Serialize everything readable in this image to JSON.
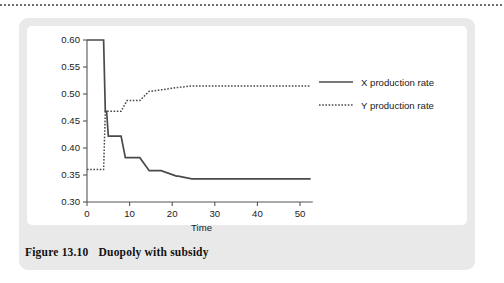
{
  "figure": {
    "caption_number": "Figure 13.10",
    "caption_text": "Duopoly with subsidy"
  },
  "chart_data": {
    "type": "line",
    "title": "",
    "xlabel": "Time",
    "ylabel": "",
    "xlim": [
      0,
      53
    ],
    "ylim": [
      0.3,
      0.6
    ],
    "xticks": [
      0,
      10,
      20,
      30,
      40,
      50
    ],
    "xtick_labels": [
      "0",
      "10",
      "20",
      "30",
      "40",
      "50"
    ],
    "yticks": [
      0.3,
      0.35,
      0.4,
      0.45,
      0.5,
      0.55,
      0.6
    ],
    "ytick_labels": [
      "0.30",
      "0.35",
      "0.40",
      "0.45",
      "0.50",
      "0.55",
      "0.60"
    ],
    "grid": false,
    "legend_position": "right",
    "line_color": "#4a4a4a",
    "series": [
      {
        "name": "X production rate",
        "style": "solid",
        "x": [
          0,
          3.6,
          3.9,
          4.3,
          4.6,
          5.0,
          5.4,
          7.6,
          8.0,
          9.0,
          9.4,
          12.0,
          12.4,
          14.6,
          15.0,
          17.0,
          17.4,
          21.0,
          21.4,
          24.6,
          25.0,
          52.5
        ],
        "y": [
          0.6,
          0.6,
          0.6,
          0.468,
          0.468,
          0.422,
          0.422,
          0.422,
          0.422,
          0.382,
          0.382,
          0.382,
          0.382,
          0.358,
          0.358,
          0.358,
          0.358,
          0.348,
          0.348,
          0.343,
          0.343,
          0.343
        ]
      },
      {
        "name": "Y production rate",
        "style": "dotted",
        "x": [
          0,
          3.6,
          3.9,
          4.3,
          4.6,
          7.6,
          8.0,
          9.4,
          9.8,
          12.0,
          12.4,
          14.6,
          15.0,
          17.4,
          17.8,
          21.0,
          21.4,
          24.6,
          25.0,
          52.5
        ],
        "y": [
          0.36,
          0.36,
          0.36,
          0.468,
          0.468,
          0.468,
          0.468,
          0.488,
          0.488,
          0.488,
          0.488,
          0.505,
          0.505,
          0.508,
          0.508,
          0.512,
          0.512,
          0.515,
          0.515,
          0.515
        ]
      }
    ]
  },
  "legend": {
    "items": [
      {
        "label": "X production rate",
        "style": "solid"
      },
      {
        "label": "Y production rate",
        "style": "dotted"
      }
    ]
  }
}
